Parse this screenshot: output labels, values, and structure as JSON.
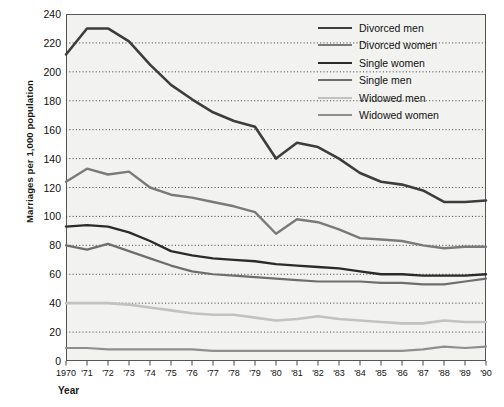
{
  "chart_data": {
    "type": "line",
    "title": "",
    "xlabel": "Year",
    "ylabel": "Marriages per 1,000 population",
    "ylim": [
      0,
      240
    ],
    "ytick_step": 20,
    "grid": true,
    "grid_style": "dotted-horizontal",
    "legend_position": "top-right",
    "x": [
      1970,
      1971,
      1972,
      1973,
      1974,
      1975,
      1976,
      1977,
      1978,
      1979,
      1980,
      1981,
      1982,
      1983,
      1984,
      1985,
      1986,
      1987,
      1988,
      1989,
      1990
    ],
    "categories": [
      "1970",
      "'71",
      "'72",
      "'73",
      "'74",
      "'75",
      "'76",
      "'77",
      "'78",
      "'79",
      "'80",
      "'81",
      "'82",
      "'83",
      "'84",
      "'85",
      "'86",
      "'87",
      "'88",
      "'89",
      "'90"
    ],
    "yticks": [
      0,
      20,
      40,
      60,
      80,
      100,
      120,
      140,
      160,
      180,
      200,
      220,
      240
    ],
    "series": [
      {
        "name": "Divorced men",
        "color": "#3d3d3d",
        "width": 2.6,
        "values": [
          212,
          230,
          230,
          221,
          205,
          191,
          181,
          172,
          166,
          162,
          140,
          151,
          148,
          140,
          130,
          124,
          122,
          118,
          110,
          110,
          111
        ]
      },
      {
        "name": "Divorced women",
        "color": "#7a7a7a",
        "width": 2.4,
        "values": [
          124,
          133,
          129,
          131,
          120,
          115,
          113,
          110,
          107,
          103,
          88,
          98,
          96,
          91,
          85,
          84,
          83,
          80,
          78,
          79,
          79
        ]
      },
      {
        "name": "Single women",
        "color": "#2b2b2b",
        "width": 2.3,
        "values": [
          93,
          94,
          93,
          89,
          83,
          76,
          73,
          71,
          70,
          69,
          67,
          66,
          65,
          64,
          62,
          60,
          60,
          59,
          59,
          59,
          60
        ]
      },
      {
        "name": "Single men",
        "color": "#6e6e6e",
        "width": 2.2,
        "values": [
          80,
          77,
          81,
          76,
          71,
          66,
          62,
          60,
          59,
          58,
          57,
          56,
          55,
          55,
          55,
          54,
          54,
          53,
          53,
          55,
          57
        ]
      },
      {
        "name": "Widowed men",
        "color": "#c2c2c2",
        "width": 2.6,
        "values": [
          40,
          40,
          40,
          39,
          37,
          35,
          33,
          32,
          32,
          30,
          28,
          29,
          31,
          29,
          28,
          27,
          26,
          26,
          28,
          27,
          27
        ]
      },
      {
        "name": "Widowed women",
        "color": "#8f8f8f",
        "width": 2.2,
        "values": [
          9,
          9,
          8,
          8,
          8,
          8,
          8,
          7,
          7,
          7,
          7,
          7,
          7,
          7,
          7,
          7,
          7,
          8,
          10,
          9,
          10
        ]
      }
    ]
  },
  "legend": {
    "items": [
      {
        "label": "Divorced men"
      },
      {
        "label": "Divorced women"
      },
      {
        "label": "Single women"
      },
      {
        "label": "Single men"
      },
      {
        "label": "Widowed men"
      },
      {
        "label": "Widowed women"
      }
    ]
  },
  "axes": {
    "x_title": "Year",
    "y_title": "Marriages per 1,000 population"
  }
}
